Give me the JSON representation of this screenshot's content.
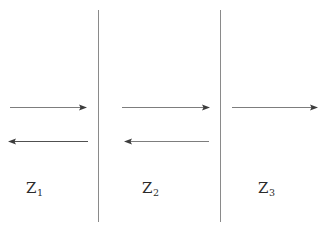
{
  "figure": {
    "width": 324,
    "height": 229,
    "background_color": "#ffffff",
    "line_color": "#8a8a8a",
    "arrow_color": "#4a4a4a",
    "text_color": "#2b2b2b"
  },
  "boundaries": [
    {
      "name": "boundary-1",
      "x": 98,
      "y_top": 10,
      "y_bottom": 222
    },
    {
      "name": "boundary-2",
      "x": 220,
      "y_top": 10,
      "y_bottom": 222
    }
  ],
  "regions": [
    {
      "id": "region-1",
      "label_base": "Z",
      "label_sub": "1",
      "label_text": "Z1",
      "arrows": [
        {
          "name": "incident-wave-region-1",
          "direction": "right",
          "x_start": 10,
          "x_end": 87,
          "y": 107
        },
        {
          "name": "reflected-wave-region-1",
          "direction": "left",
          "x_start": 88,
          "x_end": 8,
          "y": 141
        }
      ]
    },
    {
      "id": "region-2",
      "label_base": "Z",
      "label_sub": "2",
      "label_text": "Z2",
      "arrows": [
        {
          "name": "incident-wave-region-2",
          "direction": "right",
          "x_start": 122,
          "x_end": 210,
          "y": 107
        },
        {
          "name": "reflected-wave-region-2",
          "direction": "left",
          "x_start": 209,
          "x_end": 124,
          "y": 141
        }
      ]
    },
    {
      "id": "region-3",
      "label_base": "Z",
      "label_sub": "3",
      "label_text": "Z3",
      "arrows": [
        {
          "name": "transmitted-wave-region-3",
          "direction": "right",
          "x_start": 232,
          "x_end": 318,
          "y": 107
        }
      ]
    }
  ]
}
